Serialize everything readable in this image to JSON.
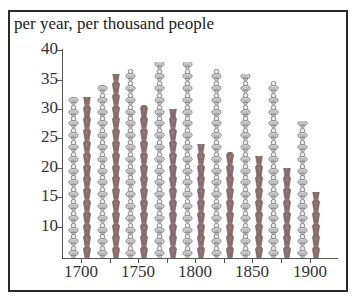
{
  "chart_data": {
    "type": "pictogram-bar",
    "title": "per year, per thousand people",
    "xlabel": "",
    "ylabel": "per year, per thousand people",
    "ylim": [
      5,
      40
    ],
    "yticks": [
      10,
      15,
      20,
      25,
      30,
      35,
      40
    ],
    "xticks": [
      1700,
      1725,
      1750,
      1775,
      1800,
      1825,
      1850,
      1875,
      1900
    ],
    "xtick_labels": [
      "1700",
      "1750",
      "1800",
      "1850",
      "1900"
    ],
    "categories": [
      1700,
      1725,
      1750,
      1775,
      1800,
      1825,
      1850,
      1875,
      1900
    ],
    "series": [
      {
        "name": "Births (baby icons)",
        "values": [
          32,
          34,
          37,
          38,
          38,
          37,
          36,
          35,
          28
        ],
        "color": "#9a9a9a"
      },
      {
        "name": "Deaths (coffin icons)",
        "values": [
          32,
          36,
          31,
          30,
          24,
          23,
          22,
          20,
          16
        ],
        "color": "#8a6a6a"
      }
    ],
    "grid": false,
    "legend": "none"
  },
  "title": "per year, per thousand people",
  "yticks": [
    "10",
    "15",
    "20",
    "25",
    "30",
    "35",
    "40"
  ],
  "xlabels": [
    "1700",
    "1750",
    "1800",
    "1850",
    "1900"
  ]
}
